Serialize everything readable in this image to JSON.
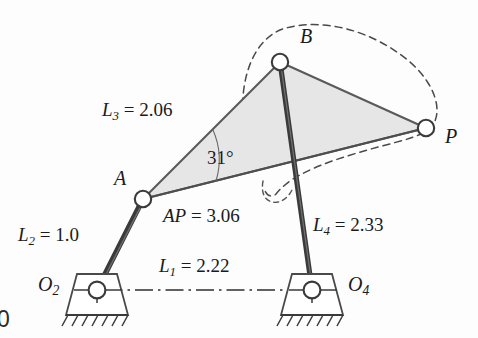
{
  "figure": {
    "corner_mark": "0"
  },
  "joints": {
    "o2": {
      "label": "O",
      "sub": "2"
    },
    "o4": {
      "label": "O",
      "sub": "4"
    },
    "a": {
      "label": "A"
    },
    "b": {
      "label": "B"
    },
    "p": {
      "label": "P"
    }
  },
  "dimensions": {
    "l1": {
      "var": "L",
      "sub": "1",
      "eq": " = ",
      "value": "2.22"
    },
    "l2": {
      "var": "L",
      "sub": "2",
      "eq": " = ",
      "value": "1.0"
    },
    "l3": {
      "var": "L",
      "sub": "3",
      "eq": " = ",
      "value": "2.06"
    },
    "l4": {
      "var": "L",
      "sub": "4",
      "eq": " = ",
      "value": "2.33"
    },
    "ap": {
      "var": "AP",
      "eq": " = ",
      "value": "3.06"
    },
    "angle": {
      "value": "31°"
    }
  },
  "colors": {
    "link_dark": "#3a3a3a",
    "coupler_fill": "#e4e4e4",
    "coupler_stroke": "#5a5a5a",
    "ground_line": "#2e2e2e",
    "coupler_curve": "#4a4a4a",
    "joint_fill": "#ffffff",
    "text": "#1a1a1a"
  },
  "geometry": {
    "o2": [
      97,
      290
    ],
    "o4": [
      312,
      290
    ],
    "a": [
      143,
      199
    ],
    "b": [
      280,
      62
    ],
    "p": [
      426,
      128
    ]
  }
}
